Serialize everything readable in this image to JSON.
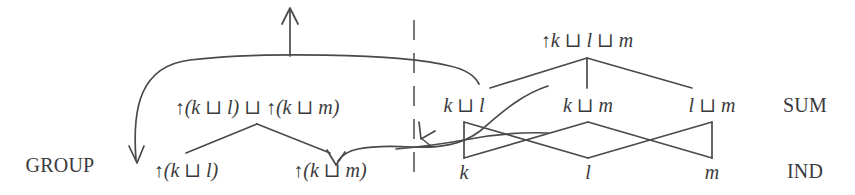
{
  "figure": {
    "stroke_color": "#4a4a4c",
    "text_color": "#3a3a3c",
    "background_color": "#ffffff",
    "width": 855,
    "height": 195
  },
  "row_labels": {
    "group": "GROUP",
    "sum": "SUM",
    "ind": "IND"
  },
  "left_lattice": {
    "top_node": "↑(k ⊔ l) ⊔ ↑(k ⊔ m)",
    "children": [
      "↑(k ⊔ l)",
      "↑(k ⊔ m)"
    ]
  },
  "right_lattice": {
    "top_node": "↑k ⊔ l ⊔ m",
    "sum_nodes": [
      "k ⊔ l",
      "k ⊔ m",
      "l ⊔ m"
    ],
    "ind_nodes": [
      "k",
      "l",
      "m"
    ]
  },
  "symbols": {
    "up_arrow": "↑",
    "join": "⊔",
    "open_paren": "(",
    "close_paren": ")"
  },
  "annotations": {
    "top_arrow": "upward-arrow-from-spanning-curve",
    "divider": "dashed-vertical-separator",
    "mapping_arrows": [
      "curve-to-left-group-bottom",
      "curve-to-right-group-m",
      "curve-to-ind-k"
    ]
  }
}
